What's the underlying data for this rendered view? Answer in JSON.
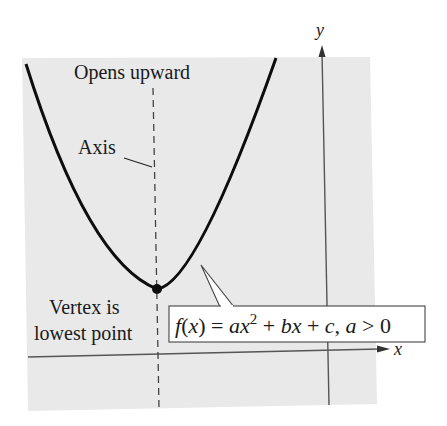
{
  "diagram": {
    "labels": {
      "opens": "Opens upward",
      "axis": "Axis",
      "vertex_line1": "Vertex is",
      "vertex_line2": "lowest point",
      "y_axis": "y",
      "x_axis": "x"
    },
    "equation": {
      "f": "f",
      "lparen": "(",
      "var": "x",
      "rparen_eq": ") = ",
      "a": "a",
      "x": "x",
      "exp": "2",
      "plus1": " + ",
      "b": "b",
      "x2": "x",
      "plus2": " + ",
      "c": "c",
      "comma": ", ",
      "a2": "a",
      "gt": " > 0",
      "full_text": "f(x) = ax² + bx + c, a > 0"
    },
    "colors": {
      "background": "#e9e9e9",
      "curve": "#0d0d0d",
      "axis": "#555555",
      "text": "#1a1a1a",
      "callout_bg": "#ffffff"
    }
  }
}
